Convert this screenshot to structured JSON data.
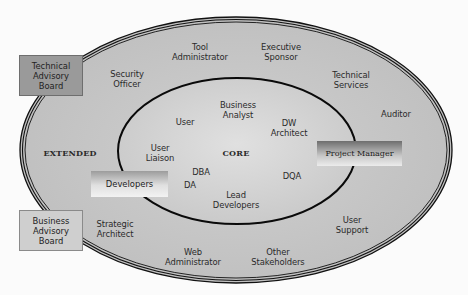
{
  "diagram": {
    "rings": [
      {
        "name": "extended",
        "label": "EXTENDED"
      },
      {
        "name": "core",
        "label": "CORE"
      }
    ],
    "colors": {
      "background": "#fbfbfb",
      "outer_fill": "#c4c4c4",
      "inner_fill": "#d4d4d4",
      "stroke": "#111111"
    },
    "extended_roles": [
      {
        "label": "Security\nOfficer",
        "x": 127,
        "y": 69
      },
      {
        "label": "Tool\nAdministrator",
        "x": 200,
        "y": 42
      },
      {
        "label": "Executive\nSponsor",
        "x": 281,
        "y": 42
      },
      {
        "label": "Technical\nServices",
        "x": 351,
        "y": 72
      },
      {
        "label": "Auditor",
        "x": 395,
        "y": 110
      },
      {
        "label": "Strategic\nArchitect",
        "x": 115,
        "y": 221
      },
      {
        "label": "Web\nAdministrator",
        "x": 193,
        "y": 249
      },
      {
        "label": "Other\nStakeholders",
        "x": 278,
        "y": 249
      },
      {
        "label": "User\nSupport",
        "x": 352,
        "y": 216
      }
    ],
    "core_roles": [
      {
        "label": "Business\nAnalyst",
        "x": 237,
        "y": 100
      },
      {
        "label": "User",
        "x": 185,
        "y": 116
      },
      {
        "label": "DW\nArchitect",
        "x": 290,
        "y": 119
      },
      {
        "label": "User\nLiaison",
        "x": 160,
        "y": 146
      },
      {
        "label": "DBA",
        "x": 199,
        "y": 168
      },
      {
        "label": "DA",
        "x": 190,
        "y": 181
      },
      {
        "label": "DQA",
        "x": 293,
        "y": 171
      },
      {
        "label": "Lead\nDevelopers",
        "x": 236,
        "y": 189
      }
    ],
    "boxes": {
      "technical_advisory_board": "Technical\nAdvisory\nBoard",
      "business_advisory_board": "Business\nAdvisory\nBoard",
      "developers": "Developers",
      "project_manager": "Project Manager"
    }
  }
}
